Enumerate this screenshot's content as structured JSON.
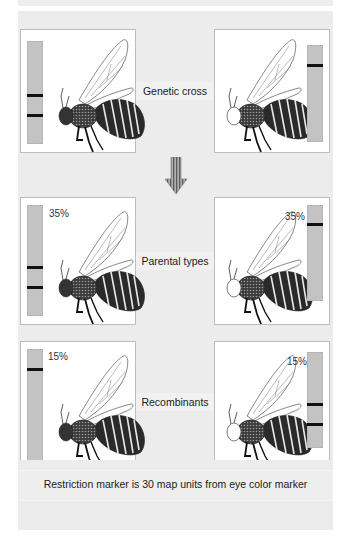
{
  "diagram": {
    "colors": {
      "background_panel": "#ececec",
      "box_fill": "#ffffff",
      "box_border": "#bdbdbd",
      "gel_strip": "#c3c3c3",
      "gel_band": "#111111",
      "arrow": "#8a8a8a"
    },
    "rows": [
      {
        "label": "Genetic cross",
        "left": {
          "percent": "",
          "eye": "dark",
          "bands": 2
        },
        "right": {
          "percent": "",
          "eye": "light",
          "bands": 1
        }
      },
      {
        "label": "Parental types",
        "left": {
          "percent": "35%",
          "eye": "dark",
          "bands": 2
        },
        "right": {
          "percent": "35%",
          "eye": "light",
          "bands": 1
        }
      },
      {
        "label": "Recombinants",
        "left": {
          "percent": "15%",
          "eye": "dark",
          "bands": 1
        },
        "right": {
          "percent": "15%",
          "eye": "light",
          "bands": 2
        }
      }
    ],
    "arrow_icon": "down-arrow-icon",
    "caption": "Restriction marker is 30 map units from eye color marker"
  }
}
